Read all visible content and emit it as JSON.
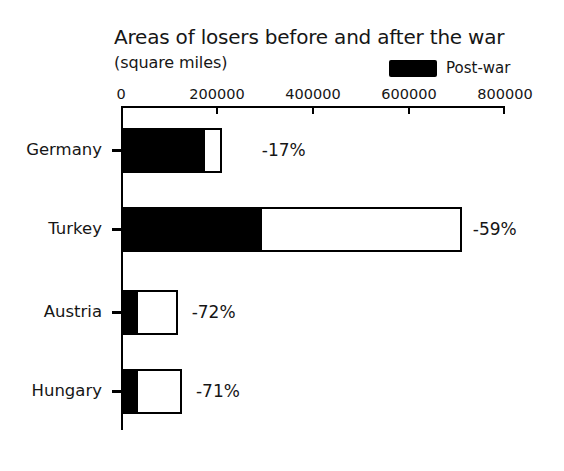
{
  "chart_data": {
    "type": "bar",
    "orientation": "horizontal",
    "title": "Areas of losers before and after the war",
    "subtitle": "(square miles)",
    "xlabel": "",
    "ylabel": "",
    "xlim": [
      0,
      800000
    ],
    "grid": false,
    "legend_position": "top-right",
    "legend": [
      {
        "name": "Post-war",
        "color": "#000000"
      }
    ],
    "categories": [
      "Germany",
      "Turkey",
      "Austria",
      "Hungary"
    ],
    "tick_labels": [
      "0",
      "200000",
      "400000",
      "600000",
      "800000"
    ],
    "tick_values": [
      0,
      200000,
      400000,
      600000,
      800000
    ],
    "series": [
      {
        "name": "Pre-war",
        "color": "#ffffff",
        "values": [
          210000,
          710000,
          118000,
          127000
        ]
      },
      {
        "name": "Post-war",
        "color": "#000000",
        "values": [
          175000,
          294000,
          35000,
          36000
        ]
      }
    ],
    "annotations": [
      {
        "category": "Germany",
        "text": "-17%",
        "value": -17
      },
      {
        "category": "Turkey",
        "text": "-59%",
        "value": -59
      },
      {
        "category": "Austria",
        "text": "-72%",
        "value": -72
      },
      {
        "category": "Hungary",
        "text": "-71%",
        "value": -71
      }
    ]
  },
  "chart": {
    "title": "Areas of losers before and after the war",
    "subtitle": "(square miles)",
    "legend_label": "Post-war",
    "ticks": [
      {
        "label": "0"
      },
      {
        "label": "200000"
      },
      {
        "label": "400000"
      },
      {
        "label": "600000"
      },
      {
        "label": "800000"
      }
    ],
    "rows": [
      {
        "label": "Germany",
        "pct": "-17%"
      },
      {
        "label": "Turkey",
        "pct": "-59%"
      },
      {
        "label": "Austria",
        "pct": "-72%"
      },
      {
        "label": "Hungary",
        "pct": "-71%"
      }
    ],
    "colors": {
      "postwar": "#000000",
      "prewar": "#ffffff",
      "axis": "#000000",
      "text": "#161616",
      "background": "#ffffff"
    }
  }
}
